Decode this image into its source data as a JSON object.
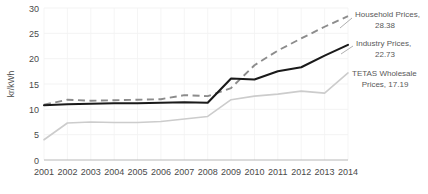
{
  "chart_data": {
    "type": "line",
    "title": "",
    "xlabel": "",
    "ylabel": "kr/kWh",
    "ylim": [
      0,
      30
    ],
    "xlim": [
      2001,
      2014
    ],
    "grid": true,
    "legend_position": "inline-annotations",
    "categories": [
      "2001",
      "2002",
      "2003",
      "2004",
      "2005",
      "2006",
      "2007",
      "2008",
      "2009",
      "2010",
      "2011",
      "2012",
      "2013",
      "2014"
    ],
    "x": [
      2001,
      2002,
      2003,
      2004,
      2005,
      2006,
      2007,
      2008,
      2009,
      2010,
      2011,
      2012,
      2013,
      2014
    ],
    "yticks": [
      0,
      5,
      10,
      15,
      20,
      25,
      30
    ],
    "ytick_labels": [
      "0",
      "5",
      "10",
      "15",
      "20",
      "25",
      "30"
    ],
    "series": [
      {
        "name": "Household Prices",
        "style": "dashed",
        "color": "#8c8c8c",
        "end_value": 28.38,
        "values": [
          10.9,
          11.9,
          11.7,
          11.8,
          11.9,
          12.0,
          12.8,
          12.6,
          14.2,
          18.7,
          21.6,
          24.0,
          26.3,
          28.38
        ]
      },
      {
        "name": "Industry Prices",
        "style": "solid",
        "color": "#1a1a1a",
        "end_value": 22.73,
        "values": [
          10.8,
          11.0,
          11.1,
          11.2,
          11.2,
          11.3,
          11.4,
          11.3,
          16.1,
          15.9,
          17.5,
          18.3,
          20.6,
          22.73
        ]
      },
      {
        "name": "TETAS Wholesale Prices",
        "style": "solid",
        "color": "#cccccc",
        "end_value": 17.19,
        "values": [
          4.0,
          7.3,
          7.5,
          7.4,
          7.4,
          7.6,
          8.1,
          8.6,
          11.9,
          12.6,
          13.0,
          13.6,
          13.2,
          17.19
        ]
      }
    ],
    "annotations": [
      {
        "id": "household",
        "line1": "Household Prices,",
        "line2": "28.38"
      },
      {
        "id": "industry",
        "line1": "Industry Prices,",
        "line2": "22.73"
      },
      {
        "id": "tetas",
        "line1": "TETAS Wholesale",
        "line2": "Prices, 17.19"
      }
    ]
  }
}
